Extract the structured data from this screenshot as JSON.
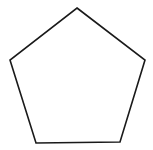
{
  "figure": {
    "shape": "pentagon",
    "width": 153,
    "height": 150,
    "background": "#ffffff",
    "stroke": "#1a1a1a",
    "stroke_width": 1.6,
    "fill": "none",
    "points": "77,8 145,60 120,142 36,143 10,60"
  }
}
